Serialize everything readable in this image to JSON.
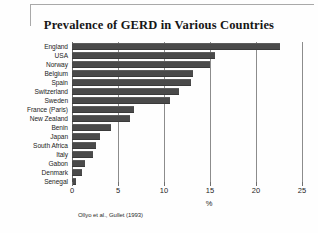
{
  "chart_data": {
    "type": "bar",
    "orientation": "horizontal",
    "title": "Prevalence of GERD in Various Countries",
    "xlabel": "%",
    "ylabel": "",
    "xlim": [
      0,
      25
    ],
    "xticks": [
      0,
      5,
      10,
      15,
      20,
      25
    ],
    "xtick_labels": [
      "0",
      "5",
      "10",
      "15",
      "20",
      "25"
    ],
    "grid": true,
    "legend": null,
    "source_note": "Ollyo et al., Gullet (1993)",
    "bar_color": "#4a4a4a",
    "categories": [
      "England",
      "USA",
      "Norway",
      "Belgium",
      "Spain",
      "Switzerland",
      "Sweden",
      "France (Paris)",
      "New Zealand",
      "Benin",
      "Japan",
      "South Africa",
      "Italy",
      "Gabon",
      "Denmark",
      "Senegal"
    ],
    "values": [
      22.6,
      15.5,
      15.0,
      13.2,
      12.9,
      11.6,
      10.6,
      6.7,
      6.3,
      4.2,
      3.0,
      2.6,
      2.3,
      1.4,
      1.1,
      0.4
    ]
  }
}
